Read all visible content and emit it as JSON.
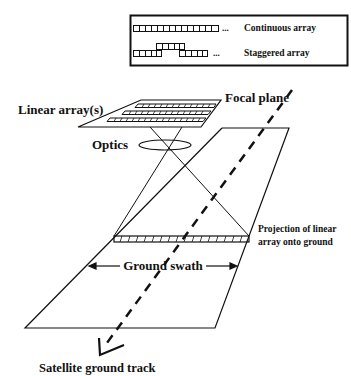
{
  "legend": {
    "continuous_label": "Continuous array",
    "staggered_label": "Staggered array",
    "ellipsis": "..."
  },
  "labels": {
    "linear_arrays": "Linear array(s)",
    "focal_plane": "Focal plane",
    "optics": "Optics",
    "projection_line1": "Projection of linear",
    "projection_line2": "array onto ground",
    "ground_swath": "Ground swath",
    "ground_track": "Satellite ground track"
  },
  "colors": {
    "ink": "#111111",
    "background": "#ffffff"
  }
}
